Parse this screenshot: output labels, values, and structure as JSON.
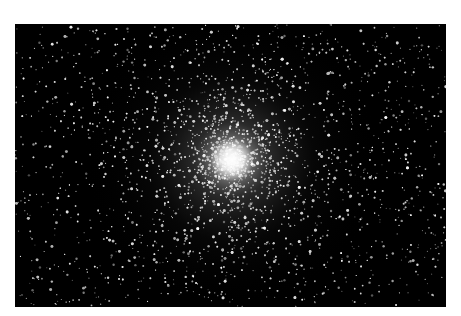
{
  "image": {
    "subject": "globular star cluster",
    "alt": "Dense globular star cluster with a bright white core against a black sky",
    "background_color": "#000000",
    "page_background": "#ffffff",
    "core": {
      "x_frac": 0.503,
      "y_frac": 0.48
    },
    "star_color": "#ffffff"
  }
}
